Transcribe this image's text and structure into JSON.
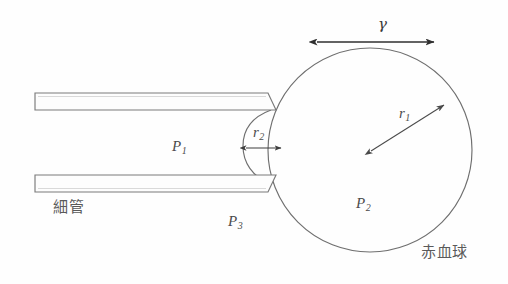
{
  "figure": {
    "type": "schematic-diagram",
    "width": 508,
    "height": 284,
    "background_color": "#fefefe",
    "line_color": "#6b6b6b",
    "arrow_color": "#3a3a3a",
    "label_color": "#4b4b4b"
  },
  "labels": {
    "gamma": "γ",
    "r1": "r",
    "r1_sub": "1",
    "r2": "r",
    "r2_sub": "2",
    "p1": "P",
    "p1_sub": "1",
    "p2": "P",
    "p2_sub": "2",
    "p3": "P",
    "p3_sub": "3",
    "capillary_tube": "細管",
    "red_blood_cell": "赤血球"
  },
  "geometry": {
    "cell_circle": {
      "cx": 370,
      "cy": 150,
      "r": 102
    },
    "tube_upper": {
      "x": 35,
      "y": 93,
      "width": 235,
      "height": 17
    },
    "tube_lower": {
      "x": 35,
      "y": 175,
      "width": 235,
      "height": 17
    },
    "meniscus": {
      "cx": 278,
      "cy": 143,
      "r": 32
    },
    "gamma_arrow": {
      "x1": 317,
      "y1": 42,
      "x2": 434,
      "y2": 42
    },
    "r1_arrow": {
      "x1": 370,
      "y1": 150,
      "x2": 443,
      "y2": 105
    },
    "r2_arrow": {
      "x1": 247,
      "y1": 148,
      "x2": 280,
      "y2": 148
    }
  }
}
